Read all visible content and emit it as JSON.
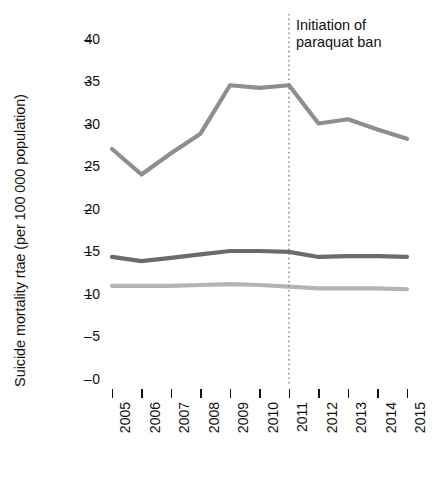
{
  "chart_data": {
    "type": "line",
    "title": "",
    "xlabel": "",
    "ylabel": "Suicide mortality rtae (per 100 000 population)",
    "x": [
      2005,
      2006,
      2007,
      2008,
      2009,
      2010,
      2011,
      2012,
      2013,
      2014,
      2015
    ],
    "categories": [
      "2005",
      "2006",
      "2007",
      "2008",
      "2009",
      "2010",
      "2011",
      "2012",
      "2013",
      "2014",
      "2015"
    ],
    "xlim": [
      2005,
      2015
    ],
    "ylim": [
      0,
      40
    ],
    "yticks": [
      0,
      5,
      10,
      15,
      20,
      25,
      30,
      35,
      40
    ],
    "ytick_labels": [
      "0",
      "5",
      "10",
      "15",
      "20",
      "25",
      "30",
      "35",
      "40"
    ],
    "grid": false,
    "legend": "none",
    "series": [
      {
        "name": "upper-line",
        "color": "#8e8e8e",
        "values": [
          27.0,
          24.0,
          26.5,
          28.8,
          34.5,
          34.2,
          34.5,
          30.0,
          30.5,
          29.3,
          28.2
        ]
      },
      {
        "name": "middle-line",
        "color": "#6b6b6b",
        "values": [
          14.3,
          13.8,
          14.2,
          14.6,
          15.0,
          15.0,
          14.9,
          14.3,
          14.4,
          14.4,
          14.3
        ]
      },
      {
        "name": "lower-line",
        "color": "#b4b4b4",
        "values": [
          10.9,
          10.9,
          10.9,
          11.0,
          11.1,
          11.0,
          10.8,
          10.6,
          10.6,
          10.6,
          10.5
        ]
      }
    ],
    "annotations": [
      {
        "name": "paraquat-ban-marker",
        "text": "Initiation of\nparaquat ban",
        "x": 2011,
        "line_style": "dotted",
        "line_color": "#7a7a7a"
      }
    ]
  },
  "axes": {
    "y_title": "Suicide mortality rtae (per 100 000 population)",
    "y_tick_labels": [
      "40",
      "35",
      "30",
      "25",
      "20",
      "15",
      "10",
      "5",
      "0"
    ],
    "y_tick_dash": "–",
    "x_tick_labels": [
      "2005",
      "2006",
      "2007",
      "2008",
      "2009",
      "2010",
      "2011",
      "2012",
      "2013",
      "2014",
      "2015"
    ]
  },
  "annotation": {
    "line1": "Initiation of",
    "line2": "paraquat ban",
    "full": "Initiation of\nparaquat ban"
  }
}
